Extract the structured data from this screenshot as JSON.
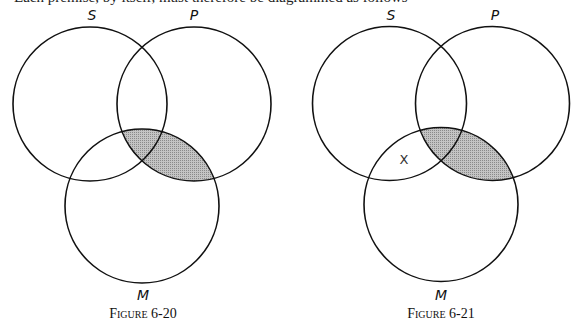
{
  "header": {
    "cut_off_text": "Each premise, by itself, must therefore be diagrammed as follows"
  },
  "shade_color": "#b4b4b4",
  "stroke_color": "#111111",
  "figures": [
    {
      "caption": "Figure 6-20",
      "labels": {
        "s": "S",
        "p": "P",
        "m": "M"
      },
      "shaded_region": "P∩M",
      "mark": ""
    },
    {
      "caption": "Figure 6-21",
      "labels": {
        "s": "S",
        "p": "P",
        "m": "M"
      },
      "shaded_region": "P∩M",
      "mark": "X"
    }
  ]
}
